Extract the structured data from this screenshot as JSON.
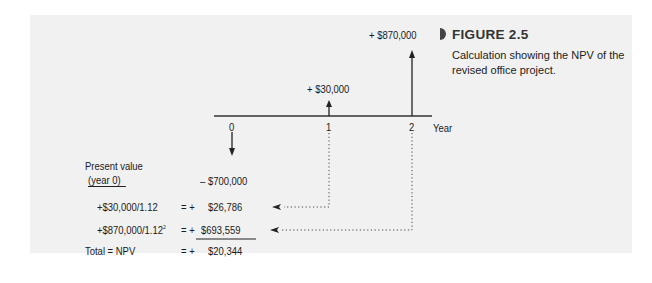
{
  "figure": {
    "label": "FIGURE 2.5",
    "caption": "Calculation showing the NPV of the revised office project."
  },
  "timeline": {
    "axis_label": "Year",
    "ticks": [
      "0",
      "1",
      "2"
    ],
    "cash_flows": [
      {
        "year": "0",
        "label": "– $700,000",
        "direction": "down"
      },
      {
        "year": "1",
        "label": "+ $30,000",
        "direction": "up"
      },
      {
        "year": "2",
        "label": "+ $870,000",
        "direction": "up"
      }
    ]
  },
  "calculation": {
    "header_line1": "Present value",
    "header_line2": "(year 0)",
    "rows": [
      {
        "expr": "",
        "eq": "",
        "value": "– $700,000"
      },
      {
        "expr": "+$30,000/1.12",
        "eq": "= +",
        "value": "$26,786"
      },
      {
        "expr": "+$870,000/1.12",
        "sup": "2",
        "eq": "= +",
        "value": "$693,559"
      },
      {
        "expr": "Total = NPV",
        "eq": "= +",
        "value": "$20,344"
      }
    ]
  }
}
